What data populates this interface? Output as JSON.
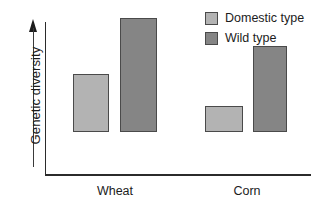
{
  "chart_data": {
    "type": "bar",
    "title": "",
    "xlabel": "",
    "ylabel": "Genetic diversity",
    "categories": [
      "Wheat",
      "Corn"
    ],
    "series": [
      {
        "name": "Domestic type",
        "color": "#b3b3b3",
        "values": [
          58,
          26
        ]
      },
      {
        "name": "Wild type",
        "color": "#858585",
        "values": [
          114,
          86
        ]
      }
    ],
    "ylim": [
      0,
      155
    ],
    "y_axis_has_ticks": false,
    "y_axis_arrow": "up",
    "grid": false,
    "legend_position": "top-right",
    "annotations": []
  },
  "axes": {
    "y_title": "Genetic diversity",
    "x_tick_labels": [
      "Wheat",
      "Corn"
    ],
    "axis_color": "#2b2b2b"
  },
  "legend": {
    "items": [
      {
        "label": "Domestic type",
        "color": "#b3b3b3"
      },
      {
        "label": "Wild type",
        "color": "#858585"
      }
    ]
  },
  "bars": [
    {
      "name": "wheat-domestic",
      "group": "Wheat",
      "series": "Domestic type",
      "left": 73,
      "width": 36,
      "height": 58,
      "color": "#b3b3b3"
    },
    {
      "name": "wheat-wild",
      "group": "Wheat",
      "series": "Wild type",
      "left": 120,
      "width": 37,
      "height": 114,
      "color": "#858585"
    },
    {
      "name": "corn-domestic",
      "group": "Corn",
      "series": "Domestic type",
      "left": 205,
      "width": 38,
      "height": 26,
      "color": "#b3b3b3"
    },
    {
      "name": "corn-wild",
      "group": "Corn",
      "series": "Wild type",
      "left": 253,
      "width": 34,
      "height": 86,
      "color": "#858585"
    }
  ],
  "x_label_positions": [
    {
      "label": "Wheat",
      "left": 75,
      "width": 80
    },
    {
      "label": "Corn",
      "left": 207,
      "width": 80
    }
  ]
}
